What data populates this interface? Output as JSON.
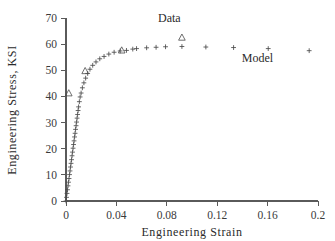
{
  "chart_data": {
    "type": "scatter",
    "title": "",
    "xlabel": "Engineering  Strain",
    "ylabel": "Engineering  Stress,  KSI",
    "xlim": [
      0,
      0.2
    ],
    "ylim": [
      0,
      70
    ],
    "xticks": [
      0,
      0.04,
      0.08,
      0.12,
      0.16,
      0.2
    ],
    "xtick_labels": [
      "0",
      "0.04",
      "0.08",
      "0.12",
      "0.16",
      "0.2"
    ],
    "yticks": [
      0,
      10,
      20,
      30,
      40,
      50,
      60,
      70
    ],
    "ytick_labels": [
      "0",
      "10",
      "20",
      "30",
      "40",
      "50",
      "60",
      "70"
    ],
    "grid": false,
    "legend_position": "inside-annotations",
    "annotations": [
      {
        "text": "Data",
        "x": 0.082,
        "y": 68.5
      },
      {
        "text": "Model",
        "x": 0.152,
        "y": 53.0
      }
    ],
    "series": [
      {
        "name": "Model",
        "marker": "plus",
        "color": "#4a4a4a",
        "x": [
          0.0,
          0.0004,
          0.0008,
          0.0012,
          0.0016,
          0.002,
          0.0024,
          0.0028,
          0.0032,
          0.0036,
          0.004,
          0.0044,
          0.0048,
          0.0052,
          0.0056,
          0.006,
          0.0064,
          0.0068,
          0.0072,
          0.0076,
          0.008,
          0.0084,
          0.0088,
          0.0092,
          0.0096,
          0.01,
          0.0106,
          0.0112,
          0.012,
          0.013,
          0.0142,
          0.0156,
          0.0172,
          0.019,
          0.0212,
          0.0238,
          0.0268,
          0.0302,
          0.034,
          0.0382,
          0.043,
          0.048,
          0.053,
          0.056,
          0.064,
          0.0715,
          0.079,
          0.092,
          0.111,
          0.133,
          0.1605,
          0.193
        ],
        "y": [
          0.0,
          1.4,
          2.9,
          4.3,
          5.8,
          7.2,
          8.6,
          10.1,
          11.5,
          13.0,
          14.4,
          15.8,
          17.3,
          18.7,
          20.2,
          21.6,
          23.0,
          24.5,
          25.9,
          27.4,
          28.8,
          30.2,
          31.7,
          33.1,
          34.6,
          36.0,
          38.0,
          39.8,
          41.3,
          43.3,
          45.2,
          47.0,
          48.8,
          50.4,
          51.9,
          53.2,
          54.4,
          55.3,
          56.2,
          56.9,
          57.4,
          57.6,
          58.1,
          58.3,
          58.6,
          58.8,
          59.0,
          59.1,
          58.9,
          58.7,
          58.3,
          57.5
        ]
      },
      {
        "name": "Data",
        "marker": "triangle",
        "color": "#4a4a4a",
        "x": [
          0.0022,
          0.0152,
          0.0442,
          0.092
        ],
        "y": [
          41.2,
          49.7,
          57.6,
          62.5
        ]
      }
    ]
  },
  "axis_labels": {
    "x_title": "Engineering  Strain",
    "y_title": "Engineering  Stress,  KSI"
  }
}
